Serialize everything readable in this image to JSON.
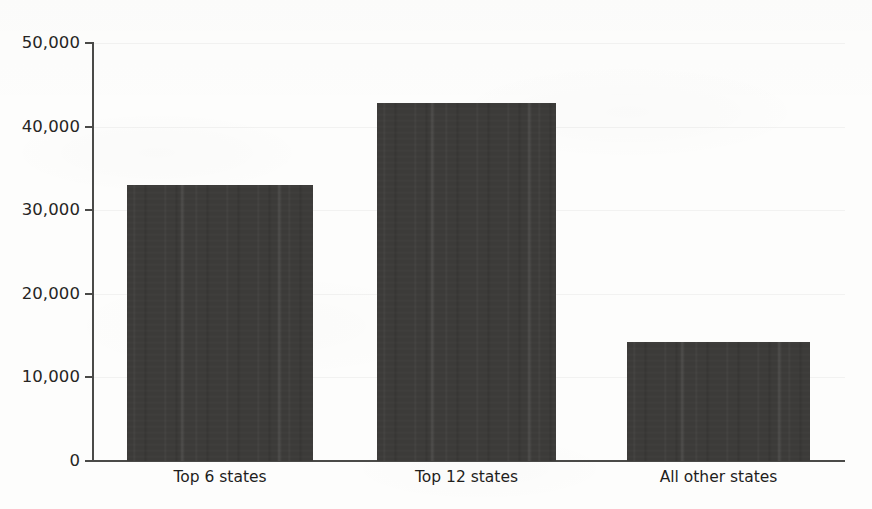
{
  "chart_data": {
    "type": "bar",
    "title": "",
    "subtitle": "",
    "xlabel": "",
    "ylabel": "",
    "categories": [
      "Top 6 states",
      "Top 12 states",
      "All other states"
    ],
    "values": [
      33000,
      42800,
      14200
    ],
    "series": [
      {
        "name": "States",
        "values": [
          33000,
          42800,
          14200
        ]
      }
    ],
    "ylim": [
      0,
      50000
    ],
    "ytick_values": [
      0,
      10000,
      20000,
      30000,
      40000,
      50000
    ],
    "ytick_labels": [
      "0",
      "10,000",
      "20,000",
      "30,000",
      "40,000",
      "50,000"
    ],
    "grid": true,
    "legend": false,
    "legend_position": "none",
    "bar_color": "#3c3b39",
    "axis_color": "#4a4a48",
    "background_color": "#fdfdfc",
    "annotations": []
  }
}
